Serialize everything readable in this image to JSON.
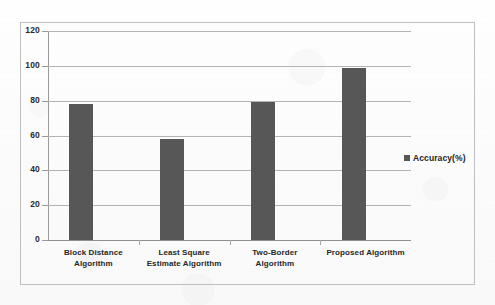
{
  "chart_data": {
    "type": "bar",
    "title": "",
    "subtitle": "",
    "xlabel": "",
    "ylabel": "",
    "categories": [
      "Block Distance Algorithm",
      "Least Square Estimate Algorithm",
      "Two-Border Algorithm",
      "Proposed Algorithm"
    ],
    "category_lines": [
      [
        "Block Distance",
        "Algorithm"
      ],
      [
        "Least Square",
        "Estimate Algorithm"
      ],
      [
        "Two-Border",
        "Algorithm"
      ],
      [
        "Proposed Algorithm",
        ""
      ]
    ],
    "series": [
      {
        "name": "Accuracy(%)",
        "values": [
          78,
          58,
          79,
          99
        ],
        "color": "#575757"
      }
    ],
    "values": [
      78,
      58,
      79,
      99
    ],
    "ylim": [
      0,
      120
    ],
    "yticks": [
      0,
      20,
      40,
      60,
      80,
      100,
      120
    ],
    "ytick_labels": [
      "0",
      "20",
      "40",
      "60",
      "80",
      "100",
      "120"
    ],
    "grid": true,
    "grid_axis": "y",
    "legend": {
      "position": "right",
      "entries": [
        {
          "label": "Accuracy(%)",
          "color": "#575757",
          "marker": "square"
        }
      ]
    },
    "colors": {
      "bar": "#575757",
      "gridline": "#b4b4b4",
      "axis": "#9a9a9a",
      "frame": "#bfbfbf",
      "background": "#fdfdfd",
      "text": "#272727"
    }
  }
}
